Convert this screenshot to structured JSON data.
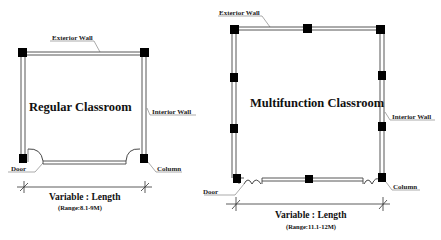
{
  "diagram": {
    "type": "architectural-floor-plan",
    "colors": {
      "wall": "#333333",
      "column": "#000000",
      "text": "#111111",
      "background": "#ffffff"
    },
    "rooms": [
      {
        "title": "Regular Classroom",
        "labels": {
          "exterior_wall": "Exterior Wall",
          "interior_wall": "Interior Wall",
          "door": "Door",
          "column": "Column"
        },
        "dimension": {
          "label": "Variable : Length",
          "range": "(Range:8.1-9M)"
        },
        "columns_count": 4
      },
      {
        "title": "Multifunction Classroom",
        "labels": {
          "exterior_wall": "Exterior Wall",
          "interior_wall": "Interior Wall",
          "door": "Door",
          "column": "Column"
        },
        "dimension": {
          "label": "Variable : Length",
          "range": "(Range:11.1-12M)"
        },
        "columns_count": 9
      }
    ]
  }
}
